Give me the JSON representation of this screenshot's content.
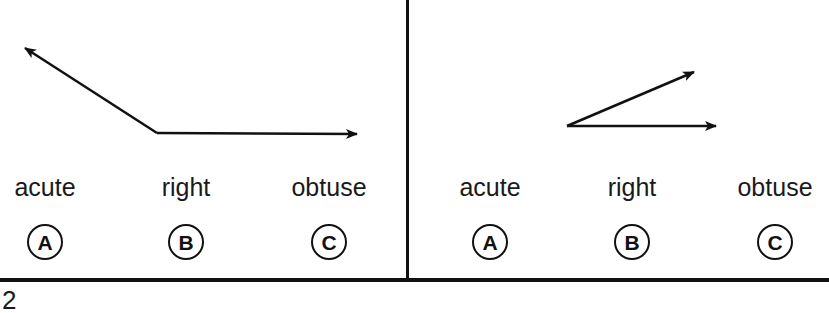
{
  "questions": [
    {
      "id": "left",
      "figure": {
        "type": "angle",
        "vertex": [
          157,
          133
        ],
        "ray1_end": [
          25,
          48
        ],
        "ray2_end": [
          357,
          134
        ],
        "stroke_color": "#111111"
      },
      "choices": [
        {
          "letter": "A",
          "label": "acute",
          "x": 45
        },
        {
          "letter": "B",
          "label": "right",
          "x": 186
        },
        {
          "letter": "C",
          "label": "obtuse",
          "x": 329
        }
      ]
    },
    {
      "id": "right",
      "figure": {
        "type": "angle",
        "vertex": [
          567,
          126
        ],
        "ray1_end": [
          694,
          72
        ],
        "ray2_end": [
          716,
          126
        ],
        "stroke_color": "#111111"
      },
      "choices": [
        {
          "letter": "A",
          "label": "acute",
          "x": 490
        },
        {
          "letter": "B",
          "label": "right",
          "x": 632
        },
        {
          "letter": "C",
          "label": "obtuse",
          "x": 775
        }
      ]
    }
  ],
  "footer": {
    "next_question_number": "2"
  }
}
